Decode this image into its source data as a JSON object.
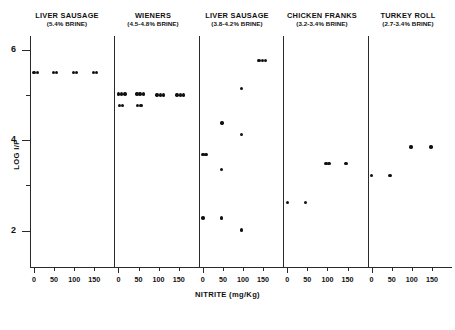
{
  "figure": {
    "ylabel": "LOG I/P",
    "xlabel": "NITRITE (mg/Kg)",
    "yticks": [
      "2",
      "4",
      "6"
    ],
    "xticks": [
      "0",
      "50",
      "100",
      "150"
    ]
  },
  "panels": [
    {
      "name": "LIVER SAUSAGE",
      "brine": "(5.4% BRINE)"
    },
    {
      "name": "WIENERS",
      "brine": "(4.5-4.8% BRINE)"
    },
    {
      "name": "LIVER SAUSAGE",
      "brine": "(3.8-4.2% BRINE)"
    },
    {
      "name": "CHICKEN FRANKS",
      "brine": "(3.2-3.4% BRINE)"
    },
    {
      "name": "TURKEY ROLL",
      "brine": "(2.7-3.4% BRINE)"
    }
  ],
  "chart_data": {
    "type": "scatter",
    "title": "",
    "xlabel": "NITRITE (mg/Kg)",
    "ylabel": "LOG I/P",
    "xlim": [
      0,
      185
    ],
    "ylim": [
      1.2,
      6.3
    ],
    "xticks": [
      0,
      50,
      100,
      150
    ],
    "yticks": [
      2,
      4,
      6
    ],
    "grid": false,
    "legend": "none",
    "panels": [
      {
        "name": "LIVER SAUSAGE",
        "brine": "(5.4% BRINE)",
        "points": [
          {
            "x": 0,
            "y": 5.5
          },
          {
            "x": 8,
            "y": 5.5
          },
          {
            "x": 48,
            "y": 5.5
          },
          {
            "x": 56,
            "y": 5.5
          },
          {
            "x": 98,
            "y": 5.5
          },
          {
            "x": 106,
            "y": 5.5
          },
          {
            "x": 148,
            "y": 5.5
          },
          {
            "x": 156,
            "y": 5.5
          }
        ]
      },
      {
        "name": "WIENERS",
        "brine": "(4.5-4.8% BRINE)",
        "points": [
          {
            "x": 0,
            "y": 5.02
          },
          {
            "x": 8,
            "y": 5.02
          },
          {
            "x": 16,
            "y": 5.02
          },
          {
            "x": 2,
            "y": 4.77
          },
          {
            "x": 10,
            "y": 4.77
          },
          {
            "x": 46,
            "y": 5.02
          },
          {
            "x": 54,
            "y": 5.02
          },
          {
            "x": 62,
            "y": 5.02
          },
          {
            "x": 48,
            "y": 4.77
          },
          {
            "x": 56,
            "y": 4.77
          },
          {
            "x": 96,
            "y": 5.0
          },
          {
            "x": 104,
            "y": 5.0
          },
          {
            "x": 112,
            "y": 5.0
          },
          {
            "x": 146,
            "y": 5.0
          },
          {
            "x": 154,
            "y": 5.0
          },
          {
            "x": 162,
            "y": 5.0
          }
        ]
      },
      {
        "name": "LIVER SAUSAGE",
        "brine": "(3.8-4.2% BRINE)",
        "points": [
          {
            "x": 140,
            "y": 5.76
          },
          {
            "x": 148,
            "y": 5.76
          },
          {
            "x": 156,
            "y": 5.76
          },
          {
            "x": 96,
            "y": 5.14
          },
          {
            "x": 48,
            "y": 4.38
          },
          {
            "x": 0,
            "y": 3.68
          },
          {
            "x": 8,
            "y": 3.68
          },
          {
            "x": 96,
            "y": 4.12
          },
          {
            "x": 46,
            "y": 3.35
          },
          {
            "x": 0,
            "y": 2.28
          },
          {
            "x": 46,
            "y": 2.28
          },
          {
            "x": 96,
            "y": 2.02
          }
        ]
      },
      {
        "name": "CHICKEN FRANKS",
        "brine": "(3.2-3.4% BRINE)",
        "points": [
          {
            "x": 96,
            "y": 3.48
          },
          {
            "x": 104,
            "y": 3.48
          },
          {
            "x": 146,
            "y": 3.48
          },
          {
            "x": 0,
            "y": 2.62
          },
          {
            "x": 46,
            "y": 2.62
          }
        ]
      },
      {
        "name": "TURKEY ROLL",
        "brine": "(2.7-3.4% BRINE)",
        "points": [
          {
            "x": 98,
            "y": 3.85
          },
          {
            "x": 148,
            "y": 3.85
          },
          {
            "x": 0,
            "y": 3.22
          },
          {
            "x": 46,
            "y": 3.22
          }
        ]
      }
    ]
  }
}
